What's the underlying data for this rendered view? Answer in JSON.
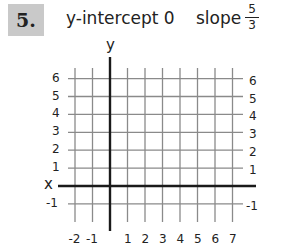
{
  "problem": {
    "number": "5.",
    "intercept_label": "y-intercept 0",
    "slope_label": "slope",
    "slope_numerator": "5",
    "slope_denominator": "3"
  },
  "axes": {
    "x_label": "x",
    "y_label": "y"
  },
  "chart_data": {
    "type": "line",
    "xlabel": "x",
    "ylabel": "y",
    "xlim": [
      -2,
      7
    ],
    "ylim": [
      -1,
      6
    ],
    "grid": true,
    "x_ticks": [
      "-2",
      "-1",
      "1",
      "2",
      "3",
      "4",
      "5",
      "6",
      "7"
    ],
    "y_ticks_left": [
      "6",
      "5",
      "4",
      "3",
      "2",
      "1",
      "-1"
    ],
    "y_ticks_right": [
      "6",
      "5",
      "4",
      "3",
      "2",
      "1",
      "-1"
    ],
    "series": []
  }
}
